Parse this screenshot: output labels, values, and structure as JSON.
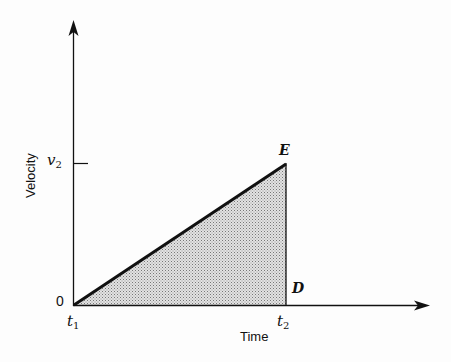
{
  "diagram": {
    "type": "velocity-time graph",
    "axes": {
      "x_label": "Time",
      "y_label": "Velocity",
      "origin_label": "0"
    },
    "ticks": {
      "y_tick_label_main": "v",
      "y_tick_label_sub": "2",
      "x_start_label_main": "t",
      "x_start_label_sub": "1",
      "x_end_label_main": "t",
      "x_end_label_sub": "2"
    },
    "points": {
      "top_right": "E",
      "bottom_right": "D"
    },
    "shaded_region": "triangle from origin to E to D (area = displacement)",
    "colors": {
      "line": "#111111",
      "fill": "#c8c8c8"
    }
  }
}
